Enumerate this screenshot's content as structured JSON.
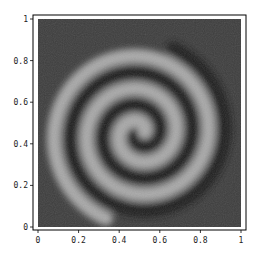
{
  "chart_data": {
    "type": "heatmap",
    "title": "",
    "xlabel": "",
    "ylabel": "",
    "xlim": [
      0,
      1
    ],
    "ylim": [
      0,
      1
    ],
    "grid": false,
    "legend": null,
    "x_ticks": [
      "0",
      "0.2",
      "0.4",
      "0.6",
      "0.8",
      "1"
    ],
    "y_ticks": [
      "0",
      "0.2",
      "0.4",
      "0.6",
      "0.8",
      "1"
    ],
    "spiral": {
      "center": [
        0.5,
        0.45
      ],
      "turns": 2.5,
      "arm_spacing": 0.16,
      "colormap": "grayscale"
    },
    "colors": {
      "background": "#3a3a3a",
      "arm_bright": "#a8a8a8",
      "arm_dark": "#1a1a1a",
      "frame": "#000000"
    }
  }
}
